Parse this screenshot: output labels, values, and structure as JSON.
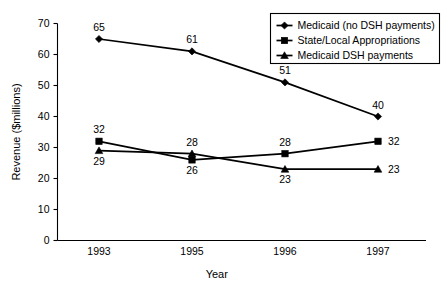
{
  "chart_data": {
    "type": "line",
    "title": "",
    "xlabel": "Year",
    "ylabel": "Revenue ($millions)",
    "categories": [
      "1993",
      "1995",
      "1996",
      "1997"
    ],
    "ylim": [
      0,
      70
    ],
    "yticks": [
      "0",
      "10",
      "20",
      "30",
      "40",
      "50",
      "60",
      "70"
    ],
    "grid": false,
    "legend_position": "top-right",
    "series": [
      {
        "name": "Medicaid (no DSH payments)",
        "marker": "diamond",
        "values": [
          65,
          61,
          51,
          40
        ],
        "labels": [
          "65",
          "61",
          "51",
          "40"
        ],
        "label_positions": [
          "above",
          "above",
          "above",
          "above"
        ]
      },
      {
        "name": "State/Local Appropriations",
        "marker": "square",
        "values": [
          32,
          26,
          28,
          32
        ],
        "labels": [
          "32",
          "26",
          "28",
          "32"
        ],
        "label_positions": [
          "above",
          "below",
          "above",
          "right"
        ]
      },
      {
        "name": "Medicaid DSH payments",
        "marker": "triangle",
        "values": [
          29,
          28,
          23,
          23
        ],
        "labels": [
          "29",
          "28",
          "23",
          "23"
        ],
        "label_positions": [
          "below",
          "above",
          "below",
          "right"
        ]
      }
    ]
  }
}
